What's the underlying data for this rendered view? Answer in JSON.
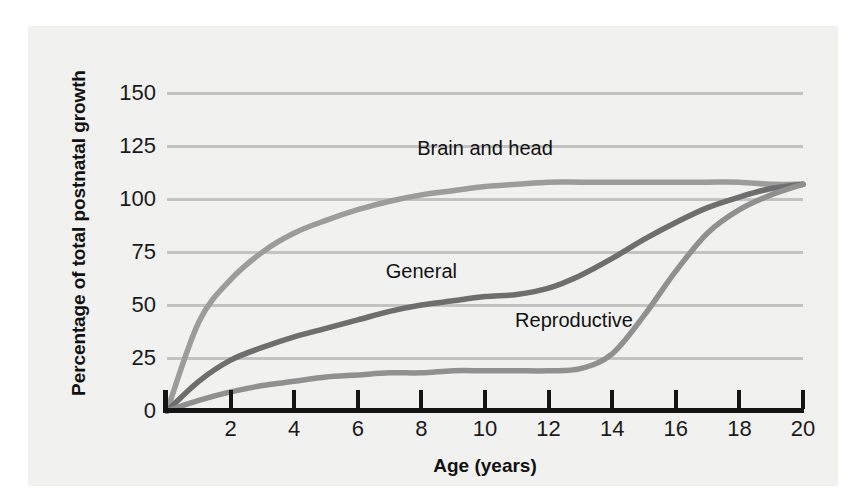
{
  "chart_data": {
    "type": "line",
    "title": "",
    "xlabel": "Age (years)",
    "ylabel": "Percentage of total postnatal growth",
    "xlim": [
      0,
      20
    ],
    "ylim": [
      0,
      160
    ],
    "grid": true,
    "grid_orientation": "horizontal",
    "legend_position": "inline-annotations",
    "x_ticks": [
      "2",
      "4",
      "6",
      "8",
      "10",
      "12",
      "14",
      "16",
      "18",
      "20"
    ],
    "x_tick_values": [
      2,
      4,
      6,
      8,
      10,
      12,
      14,
      16,
      18,
      20
    ],
    "y_ticks": [
      "0",
      "25",
      "50",
      "75",
      "100",
      "125",
      "150"
    ],
    "y_tick_values": [
      0,
      25,
      50,
      75,
      100,
      125,
      150
    ],
    "x": [
      0,
      1,
      2,
      3,
      4,
      5,
      6,
      7,
      8,
      9,
      10,
      11,
      12,
      13,
      14,
      15,
      16,
      17,
      18,
      19,
      20
    ],
    "series": [
      {
        "name": "Brain and head",
        "color": "#9c9c9c",
        "label_x": 10.0,
        "label_y": 124,
        "values": [
          0,
          42,
          62,
          75,
          84,
          90,
          95,
          99,
          102,
          104,
          106,
          107,
          108,
          108,
          108,
          108,
          108,
          108,
          108,
          107,
          107
        ]
      },
      {
        "name": "General",
        "color": "#6e6e6e",
        "label_x": 8.0,
        "label_y": 66,
        "values": [
          0,
          14,
          24,
          30,
          35,
          39,
          43,
          47,
          50,
          52,
          54,
          55,
          58,
          64,
          72,
          81,
          89,
          96,
          101,
          105,
          107
        ]
      },
      {
        "name": "Reproductive",
        "color": "#909090",
        "label_x": 12.8,
        "label_y": 43,
        "values": [
          0,
          5,
          9,
          12,
          14,
          16,
          17,
          18,
          18,
          19,
          19,
          19,
          19,
          20,
          27,
          45,
          66,
          84,
          95,
          102,
          107
        ]
      }
    ]
  }
}
